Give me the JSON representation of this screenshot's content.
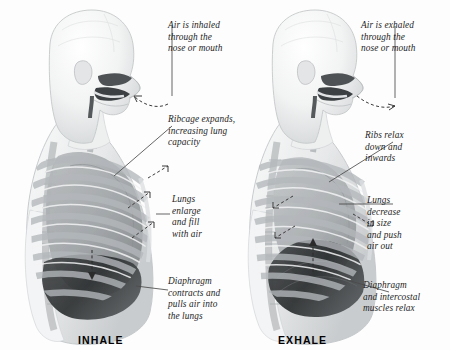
{
  "figure": {
    "background_color": "#fdfdfd",
    "text_color": "#1d1d1d",
    "leader_line_color": "#4a4a4a"
  },
  "panels": [
    {
      "id": "inhale",
      "caption": "INHALE",
      "callouts": [
        {
          "id": "air-in",
          "text": "Air is inhaled\nthrough the\nnose or mouth"
        },
        {
          "id": "ribcage",
          "text": "Ribcage expands,\nincreasing lung\ncapacity"
        },
        {
          "id": "lungs",
          "text": "Lungs\nenlarge\nand fill\nwith air"
        },
        {
          "id": "diaphragm",
          "text": "Diaphragm\ncontracts and\npulls air into\nthe lungs"
        }
      ]
    },
    {
      "id": "exhale",
      "caption": "EXHALE",
      "callouts": [
        {
          "id": "air-out",
          "text": "Air is exhaled\nthrough the\nnose or mouth"
        },
        {
          "id": "ribs",
          "text": "Ribs relax\ndown and\ninwards"
        },
        {
          "id": "lungs",
          "text": "Lungs\ndecrease\nin size\nand push\nair out"
        },
        {
          "id": "diaphragm",
          "text": "Diaphragm\nand intercostal\nmuscles relax"
        }
      ]
    }
  ],
  "anatomy": {
    "parts": [
      "head-profile",
      "nasal-cavity",
      "oral-cavity",
      "trachea",
      "ribcage",
      "lung",
      "diaphragm",
      "spine",
      "torso-outline"
    ],
    "airflow_arrow_style": "dashed-curved"
  }
}
